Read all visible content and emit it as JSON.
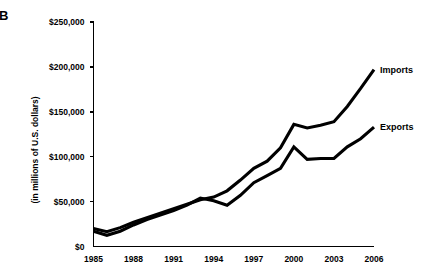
{
  "figure": {
    "panel_letter": "B",
    "background_color": "#ffffff",
    "line_color": "#000000"
  },
  "chart_data": {
    "type": "line",
    "title": "",
    "xlabel": "",
    "ylabel": "(in millions of U.S. dollars)",
    "xlim": [
      1985,
      2006
    ],
    "ylim": [
      0,
      250000
    ],
    "grid": false,
    "legend_position": "right-inline",
    "x_tick_labels": [
      "1985",
      "1988",
      "1991",
      "1994",
      "1997",
      "2000",
      "2003",
      "2006"
    ],
    "x_tick_values": [
      1985,
      1988,
      1991,
      1994,
      1997,
      2000,
      2003,
      2006
    ],
    "y_tick_labels": [
      "$0",
      "$50,000",
      "$100,000",
      "$150,000",
      "$200,000",
      "$250,000"
    ],
    "y_tick_values": [
      0,
      50000,
      100000,
      150000,
      200000,
      250000
    ],
    "x": [
      1985,
      1986,
      1987,
      1988,
      1989,
      1990,
      1991,
      1992,
      1993,
      1994,
      1995,
      1996,
      1997,
      1998,
      1999,
      2000,
      2001,
      2002,
      2003,
      2004,
      2005,
      2006
    ],
    "series": [
      {
        "name": "Imports",
        "label": "Imports",
        "color": "#000000",
        "values": [
          20000,
          16500,
          21000,
          27000,
          32000,
          37000,
          42000,
          47000,
          52000,
          55000,
          62000,
          74000,
          87000,
          95000,
          110000,
          136000,
          132000,
          135000,
          139000,
          156000,
          176000,
          197000
        ]
      },
      {
        "name": "Exports",
        "label": "Exports",
        "color": "#000000",
        "values": [
          17000,
          12500,
          17000,
          24000,
          30000,
          35000,
          40000,
          46000,
          54000,
          51000,
          46000,
          57000,
          71000,
          79000,
          87000,
          111000,
          97000,
          98000,
          98000,
          111000,
          120000,
          133000
        ]
      }
    ]
  }
}
